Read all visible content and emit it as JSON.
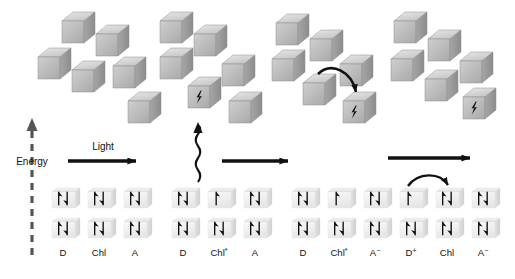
{
  "figure": {
    "type": "scientific-diagram",
    "background_color": "#ffffff",
    "ink_color": "#111111",
    "cube_fill_top": "#d8d8d8",
    "cube_fill_front": "#bdbdbd",
    "cube_fill_side": "#9e9e9e",
    "orbital_box_fill": "#f0f0f0",
    "orbital_box_shade": "#dcdcdc"
  },
  "axes": {
    "energy_label": "Energy",
    "energy_arrow": "dashed-up-arrow",
    "light_label": "Light"
  },
  "arrows": {
    "step1_label": "Light",
    "step1_name": "light-arrow",
    "step2_name": "excitation-wavy-arrow",
    "step3_name": "transfer-arrow",
    "step4_name": "recombination-arrow",
    "cube_transfer_name": "cube-electron-transfer-arrow",
    "orbital_transfer_name": "orbital-electron-transfer-arrow"
  },
  "panels": [
    {
      "id": "panel-1",
      "name": "ground-state-panel",
      "labels": [
        "D",
        "Chl",
        "A"
      ],
      "label_sup": [
        "",
        "",
        ""
      ],
      "orbitals": [
        {
          "species": "D",
          "top": "pair",
          "bottom": "pair"
        },
        {
          "species": "Chl",
          "top": "pair",
          "bottom": "pair"
        },
        {
          "species": "A",
          "top": "pair",
          "bottom": "pair"
        }
      ],
      "cube_marked_index": -1,
      "cube_count": 6
    },
    {
      "id": "panel-2",
      "name": "excited-state-panel",
      "labels": [
        "D",
        "Chl",
        "A"
      ],
      "label_sup": [
        "",
        "*",
        ""
      ],
      "orbitals": [
        {
          "species": "D",
          "top": "pair",
          "bottom": "pair"
        },
        {
          "species": "Chl*",
          "top": "single",
          "bottom": "pair"
        },
        {
          "species": "A",
          "top": "pair",
          "bottom": "pair"
        }
      ],
      "cube_marked_index": 3,
      "cube_count": 6
    },
    {
      "id": "panel-3",
      "name": "charge-separated-panel",
      "labels": [
        "D",
        "Chl",
        "A"
      ],
      "label_sup": [
        "",
        "*",
        "−"
      ],
      "orbitals": [
        {
          "species": "D",
          "top": "pair",
          "bottom": "pair"
        },
        {
          "species": "Chl*",
          "top": "single",
          "bottom": "pair"
        },
        {
          "species": "A−",
          "top": "pair",
          "bottom": "pair"
        }
      ],
      "cube_marked_index": 5,
      "cube_count": 6
    },
    {
      "id": "panel-4",
      "name": "donor-oxidized-panel",
      "labels": [
        "D",
        "Chl",
        "A"
      ],
      "label_sup": [
        "+",
        "",
        "−"
      ],
      "orbitals": [
        {
          "species": "D+",
          "top": "single",
          "bottom": "pair"
        },
        {
          "species": "Chl",
          "top": "pair",
          "bottom": "pair"
        },
        {
          "species": "A−",
          "top": "pair",
          "bottom": "pair"
        }
      ],
      "cube_marked_index": 5,
      "cube_count": 6
    }
  ],
  "legend_text": {
    "D": "D",
    "Chl": "Chl",
    "A": "A",
    "Chl_excited": "Chl*",
    "A_anion": "A−",
    "D_cation": "D+"
  }
}
